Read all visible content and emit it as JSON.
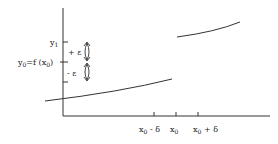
{
  "diagram": {
    "type": "discontinuous-function-epsilon-delta",
    "y_labels": {
      "y1": "y",
      "y1_sub": "1",
      "y0": "y",
      "y0_sub": "0",
      "y0_rest": "=f (x",
      "y0_rest_sub": "0",
      "y0_close": ")"
    },
    "epsilon_labels": {
      "plus": "+ ε",
      "minus": "- ε"
    },
    "x_labels": {
      "left": {
        "main": "x",
        "sub": "0",
        "suffix": " - δ"
      },
      "center": {
        "main": "x",
        "sub": "0",
        "suffix": ""
      },
      "right": {
        "main": "x",
        "sub": "0",
        "suffix": " + δ"
      }
    },
    "colors": {
      "stroke": "#333333",
      "background": "#ffffff"
    }
  }
}
